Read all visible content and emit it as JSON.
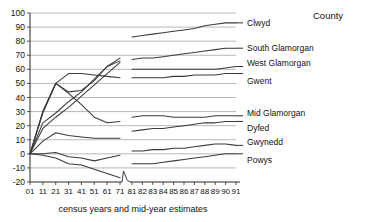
{
  "legend_title": "County",
  "caption": "census years and mid-year estimates",
  "chart_data": {
    "type": "line",
    "title": "",
    "subtitle": "",
    "xlabel": "census years and mid-year estimates",
    "ylabel": "",
    "legend_title": "County",
    "legend_position": "right",
    "grid": true,
    "ylim": [
      -20,
      100
    ],
    "ytick_step": 10,
    "yticks": [
      -20,
      -10,
      0,
      10,
      20,
      30,
      40,
      50,
      60,
      70,
      80,
      90,
      100
    ],
    "ytick_labels": [
      "-20",
      "-10",
      "0",
      "10",
      "20",
      "30",
      "40",
      "50",
      "60",
      "70",
      "80",
      "90",
      "100"
    ],
    "x_axis_note": "decennial census years 01-71, axis break, then annual mid-year estimates 81-91",
    "x_break_after": "71",
    "categories": [
      "01",
      "11",
      "21",
      "31",
      "41",
      "51",
      "61",
      "71",
      "81",
      "82",
      "83",
      "84",
      "85",
      "86",
      "87",
      "88",
      "89",
      "90",
      "91"
    ],
    "xtick_labels": [
      "01",
      "11",
      "21",
      "31",
      "41",
      "51",
      "61",
      "71",
      "81",
      "82",
      "83",
      "84",
      "85",
      "86",
      "87",
      "88",
      "89",
      "90",
      "91"
    ],
    "series": [
      {
        "name": "Clwyd",
        "label": "Clwyd",
        "values": [
          0,
          22,
          29,
          37,
          44,
          53,
          62,
          68,
          83,
          84,
          85,
          86,
          87,
          88,
          89,
          91,
          92,
          93,
          93
        ]
      },
      {
        "name": "South Glamorgan",
        "label": "South Glamorgan",
        "values": [
          0,
          18,
          26,
          33,
          41,
          49,
          57,
          65,
          67,
          68,
          68,
          69,
          70,
          71,
          72,
          73,
          74,
          75,
          75
        ]
      },
      {
        "name": "West Glamorgan",
        "label": "West Glamorgan",
        "values": [
          0,
          30,
          50,
          44,
          45,
          52,
          62,
          66,
          60,
          60,
          60,
          60,
          60,
          60,
          60,
          60,
          60,
          61,
          62
        ]
      },
      {
        "name": "Gwent",
        "label": "Gwent",
        "values": [
          0,
          29,
          50,
          57,
          57,
          56,
          55,
          54,
          54,
          54,
          54,
          54,
          55,
          55,
          56,
          56,
          56,
          57,
          57
        ]
      },
      {
        "name": "Mid Glamorgan",
        "label": "Mid Glamorgan",
        "values": [
          0,
          30,
          50,
          43,
          35,
          26,
          22,
          23,
          26,
          27,
          27,
          27,
          26,
          26,
          26,
          26,
          27,
          27,
          27
        ]
      },
      {
        "name": "Dyfed",
        "label": "Dyfed",
        "values": [
          0,
          9,
          15,
          13,
          12,
          11,
          11,
          11,
          16,
          17,
          18,
          18,
          19,
          20,
          21,
          22,
          22,
          23,
          23
        ]
      },
      {
        "name": "Gwynedd",
        "label": "Gwynedd",
        "values": [
          0,
          0,
          1,
          -2,
          -3,
          -5,
          -3,
          -1,
          2,
          2,
          3,
          3,
          4,
          4,
          5,
          6,
          7,
          7,
          6
        ]
      },
      {
        "name": "Powys",
        "label": "Powys",
        "values": [
          0,
          -1,
          -3,
          -7,
          -8,
          -11,
          -14,
          -17,
          -7,
          -7,
          -7,
          -6,
          -5,
          -4,
          -3,
          -2,
          -1,
          0,
          0
        ]
      }
    ],
    "series_label_order": [
      "Clwyd",
      "South Glamorgan",
      "West Glamorgan",
      "Gwent",
      "Mid Glamorgan",
      "Dyfed",
      "Gwynedd",
      "Powys"
    ]
  }
}
